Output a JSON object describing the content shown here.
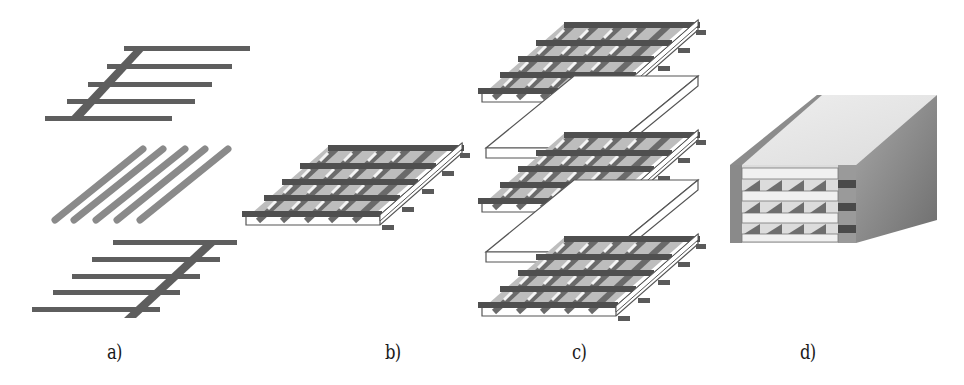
{
  "figure": {
    "panels": [
      {
        "id": "a",
        "label": "a)",
        "label_x": 107,
        "description": "Exploded components: top comb electrode, diagonal rods, bottom comb electrode"
      },
      {
        "id": "b",
        "label": "b)",
        "label_x": 385,
        "description": "Assembled single grid layer"
      },
      {
        "id": "c",
        "label": "c)",
        "label_x": 572,
        "description": "Stack of three grid layers separated by plates"
      },
      {
        "id": "d",
        "label": "d)",
        "label_x": 800,
        "description": "Encapsulated multilayer block"
      }
    ]
  },
  "colors": {
    "background": "#ffffff",
    "dark_bar": "#5c5c5c",
    "rod": "#8a8a8a",
    "grid_fill": "#7a7a7a",
    "cell_light": "#ededed",
    "outline": "#555555",
    "block_top": "#e4e4e4",
    "block_left_edge": "#8c8c8c",
    "block_side": "#8f8f8f",
    "block_front": "#d9d9d9",
    "label_text": "#1a1a1a"
  }
}
